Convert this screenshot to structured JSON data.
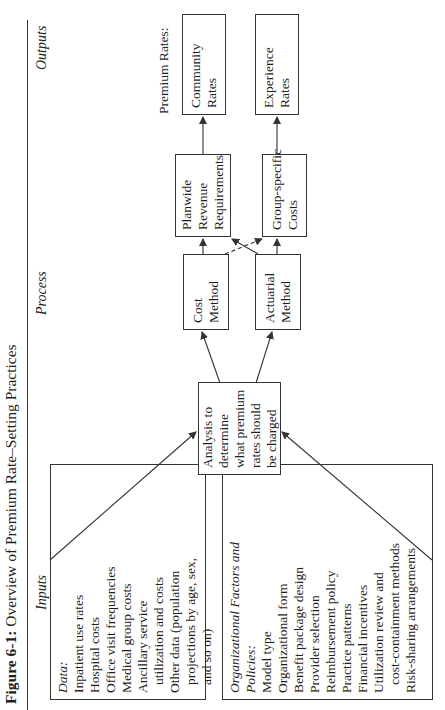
{
  "figure": {
    "label": "Figure 6-1:",
    "title": "Overview of Premium Rate–Setting Practices"
  },
  "columns": {
    "inputs": "Inputs",
    "process": "Process",
    "outputs": "Outputs"
  },
  "inputs": {
    "data_box": {
      "heading": "Data:",
      "items": [
        "Inpatient use rates",
        "Hospital costs",
        "Office visit frequencies",
        "Medical group costs",
        "Ancillary service",
        "utilization and costs",
        "Other data (population",
        "projections by age, sex,",
        "and so on)"
      ]
    },
    "org_box": {
      "heading_line1": "Organizational Factors and",
      "heading_line2": "Policies:",
      "items": [
        "Model type",
        "Organizational form",
        "Benefit package design",
        "Provider selection",
        "Reimbursement policy",
        "Practice patterns",
        "Financial incentives",
        "Utilization review and",
        "cost-containment methods",
        "Risk-sharing arrangements"
      ]
    }
  },
  "process": {
    "analysis": [
      "Analysis to",
      "determine",
      "what premium",
      "rates should",
      "be charged"
    ],
    "cost_method": [
      "Cost",
      "Method"
    ],
    "actuarial_method": [
      "Actuarial",
      "Method"
    ],
    "planwide": [
      "Planwide",
      "Revenue",
      "Requirements"
    ],
    "group_specific": [
      "Group-specific",
      "Costs"
    ]
  },
  "outputs": {
    "label": "Premium Rates:",
    "community": [
      "Community",
      "Rates"
    ],
    "experience": [
      "Experience",
      "Rates"
    ]
  },
  "colors": {
    "line": "#333333",
    "text": "#1e1e1e",
    "background": "#ffffff"
  }
}
